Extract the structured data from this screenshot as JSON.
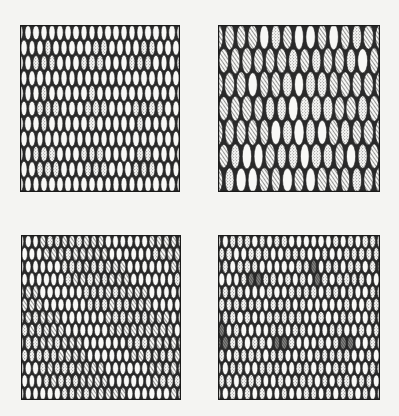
{
  "figure": {
    "fill_kinds": [
      "plain",
      "stipple",
      "hatch",
      "dense"
    ],
    "ink_color": "#1a1a1a",
    "paper_color": "#f4f4f2",
    "panels": [
      {
        "id": "top-left",
        "label": "",
        "pattern": "diamond-lattice",
        "fills": [
          "plain",
          "stipple"
        ],
        "summary": "Stippled diamonds arranged in a regular lattice separated by bands of plain white ellipses."
      },
      {
        "id": "top-right",
        "label": "",
        "pattern": "large-rhombus-mixed",
        "fills": [
          "plain",
          "stipple",
          "hatch"
        ],
        "summary": "Large irregular rhombus of plain and stippled cells surrounded by diagonally hatched cells; coarse, long ellipses."
      },
      {
        "id": "bottom-left",
        "label": "",
        "pattern": "vertical-column-blocks",
        "fills": [
          "plain",
          "stipple",
          "hatch"
        ],
        "summary": "Columns of small ellipses forming rectangular blocks of hatch/stipple alternating with plain cells."
      },
      {
        "id": "bottom-right",
        "label": "",
        "pattern": "sparse-dark-diamonds",
        "fills": [
          "plain",
          "stipple",
          "dense"
        ],
        "summary": "Mostly stippled/plain background with scattered dark cross-hatched diamond clusters."
      }
    ]
  }
}
